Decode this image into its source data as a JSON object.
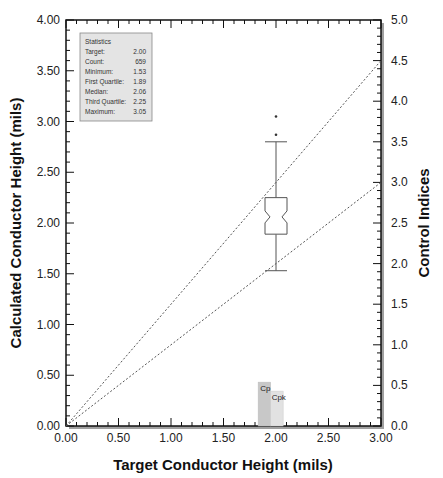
{
  "chart_data": {
    "type": "box",
    "title": "",
    "xlabel": "Target Conductor Height (mils)",
    "ylabel": "Calculated Conductor Height (mils)",
    "y2label": "Control Indices",
    "xlim": [
      0,
      3.0
    ],
    "ylim": [
      0,
      4.0
    ],
    "y2lim": [
      0,
      5.0
    ],
    "grid": false,
    "x_ticks": [
      "0.00",
      "0.50",
      "1.00",
      "1.50",
      "2.00",
      "2.50",
      "3.00"
    ],
    "y_ticks": [
      "0.00",
      "0.50",
      "1.00",
      "1.50",
      "2.00",
      "2.50",
      "3.00",
      "3.50",
      "4.00"
    ],
    "y2_ticks": [
      "0.0",
      "0.5",
      "1.0",
      "1.5",
      "2.0",
      "2.5",
      "3.0",
      "3.5",
      "4.0",
      "4.5",
      "5.0"
    ],
    "boxplot": {
      "x": 2.0,
      "min": 1.53,
      "q1": 1.89,
      "median": 2.06,
      "q3": 2.25,
      "upper_whisker": 2.8,
      "max": 3.05,
      "outliers": [
        2.87,
        3.05
      ]
    },
    "reference_lines": [
      {
        "name": "upper limit line",
        "style": "dashed",
        "from": [
          0,
          0
        ],
        "to": [
          3.0,
          4.5
        ],
        "axis": "y2"
      },
      {
        "name": "lower limit line",
        "style": "dashed",
        "from": [
          0,
          0
        ],
        "to": [
          3.0,
          3.0
        ],
        "axis": "y2"
      }
    ],
    "bars": {
      "axis": "y2",
      "categories": [
        "Cp",
        "Cpk"
      ],
      "values": [
        0.54,
        0.43
      ]
    },
    "statistics_box": {
      "title": "Statistics",
      "rows": [
        {
          "label": "Target:",
          "value": "2.00"
        },
        {
          "label": "Count:",
          "value": "659"
        },
        {
          "label": "Minimum:",
          "value": "1.53"
        },
        {
          "label": "First Quartile:",
          "value": "1.89"
        },
        {
          "label": "Median:",
          "value": "2.06"
        },
        {
          "label": "Third Quartile:",
          "value": "2.25"
        },
        {
          "label": "Maximum:",
          "value": "3.05"
        }
      ]
    }
  },
  "colors": {
    "frame": "#111111",
    "shadow": "#9a9a9a",
    "stats_bg": "#e4e4e4",
    "cp_bar": "#c8c8c8",
    "cpk_bar": "#e2e2e2",
    "box_stroke": "#555555",
    "dash_line": "#555555"
  }
}
